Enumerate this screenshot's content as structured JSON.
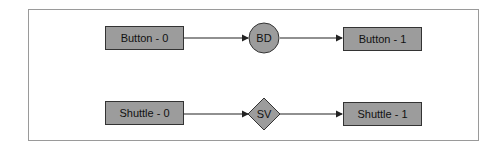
{
  "diagram": {
    "rows": [
      {
        "start": "Button - 0",
        "connector": "BD",
        "connector_shape": "circle",
        "end": "Button - 1"
      },
      {
        "start": "Shuttle - 0",
        "connector": "SV",
        "connector_shape": "diamond",
        "end": "Shuttle - 1"
      }
    ],
    "colors": {
      "node_fill": "#9c9c9c",
      "stroke": "#222222",
      "frame": "#9a9a9a"
    }
  }
}
